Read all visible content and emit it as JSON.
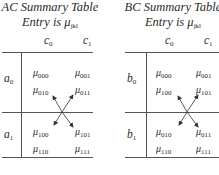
{
  "tables": [
    {
      "title": "AC Summary Table",
      "entry_label": "Entry is",
      "entry_symbol": "μ",
      "entry_sub": "jkl",
      "columns": [
        {
          "base": "c",
          "sub": "0"
        },
        {
          "base": "c",
          "sub": "1"
        }
      ],
      "rows": [
        {
          "label_base": "a",
          "label_sub": "0",
          "cells": [
            [
              {
                "sym": "μ",
                "sub": "000"
              },
              {
                "sym": "μ",
                "sub": "010"
              }
            ],
            [
              {
                "sym": "μ",
                "sub": "001"
              },
              {
                "sym": "μ",
                "sub": "011"
              }
            ]
          ]
        },
        {
          "label_base": "a",
          "label_sub": "1",
          "cells": [
            [
              {
                "sym": "μ",
                "sub": "100"
              },
              {
                "sym": "μ",
                "sub": "110"
              }
            ],
            [
              {
                "sym": "μ",
                "sub": "101"
              },
              {
                "sym": "μ",
                "sub": "111"
              }
            ]
          ]
        }
      ]
    },
    {
      "title": "BC Summary Table",
      "entry_label": "Entry is",
      "entry_symbol": "μ",
      "entry_sub": "jkl",
      "columns": [
        {
          "base": "c",
          "sub": "0"
        },
        {
          "base": "c",
          "sub": "1"
        }
      ],
      "rows": [
        {
          "label_base": "b",
          "label_sub": "0",
          "cells": [
            [
              {
                "sym": "μ",
                "sub": "000"
              },
              {
                "sym": "μ",
                "sub": "100"
              }
            ],
            [
              {
                "sym": "μ",
                "sub": "001"
              },
              {
                "sym": "μ",
                "sub": "101"
              }
            ]
          ]
        },
        {
          "label_base": "b",
          "label_sub": "1",
          "cells": [
            [
              {
                "sym": "μ",
                "sub": "010"
              },
              {
                "sym": "μ",
                "sub": "110"
              }
            ],
            [
              {
                "sym": "μ",
                "sub": "011"
              },
              {
                "sym": "μ",
                "sub": "111"
              }
            ]
          ]
        }
      ]
    }
  ],
  "colors": {
    "ink": "#2a2a2a",
    "rule": "#555555"
  }
}
